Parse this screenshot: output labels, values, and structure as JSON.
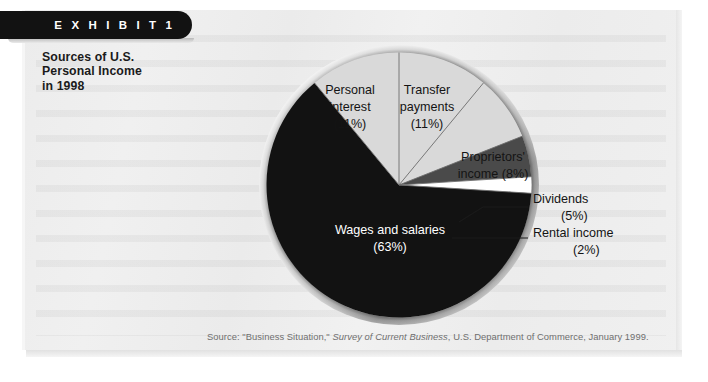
{
  "exhibit": {
    "tab_label": "E X H I B I T   1",
    "title_line1": "Sources of U.S.",
    "title_line2": "Personal Income",
    "title_line3": "in 1998"
  },
  "source_note": {
    "prefix": "Source: \"Business Situation,\" ",
    "italic": "Survey of Current Business",
    "suffix": ", U.S. Department of Commerce, January 1999."
  },
  "chart_data": {
    "type": "pie",
    "title": "Sources of U.S. Personal Income in 1998",
    "units": "percent",
    "legend": "none",
    "start_angle_deg": 0,
    "direction": "clockwise",
    "categories": [
      "Transfer payments",
      "Proprietors' income",
      "Dividends",
      "Rental income",
      "Wages and salaries",
      "Personal interest"
    ],
    "values": [
      11,
      8,
      5,
      2,
      63,
      11
    ],
    "colors": [
      "#d9d9d9",
      "#d9d9d9",
      "#4a4a4a",
      "#ffffff",
      "#121212",
      "#d9d9d9"
    ],
    "slices": [
      {
        "name": "Transfer payments",
        "label_line1": "Transfer",
        "label_line2": "payments",
        "value_label": "(11%)",
        "value": 11,
        "color": "#d9d9d9",
        "label_placement": "inside"
      },
      {
        "name": "Proprietors' income",
        "label_line1": "Proprietors'",
        "label_line2": "income (8%)",
        "value_label": "(8%)",
        "value": 8,
        "color": "#d9d9d9",
        "label_placement": "inside"
      },
      {
        "name": "Dividends",
        "label_line1": "Dividends",
        "label_line2": "(5%)",
        "value_label": "(5%)",
        "value": 5,
        "color": "#4a4a4a",
        "label_placement": "callout"
      },
      {
        "name": "Rental income",
        "label_line1": "Rental income",
        "label_line2": "(2%)",
        "value_label": "(2%)",
        "value": 2,
        "color": "#ffffff",
        "label_placement": "callout"
      },
      {
        "name": "Wages and salaries",
        "label_line1": "Wages and salaries",
        "label_line2": "(63%)",
        "value_label": "(63%)",
        "value": 63,
        "color": "#121212",
        "label_placement": "inside"
      },
      {
        "name": "Personal interest",
        "label_line1": "Personal",
        "label_line2": "interest",
        "label_line3": "(11%)",
        "value_label": "(11%)",
        "value": 11,
        "color": "#d9d9d9",
        "label_placement": "inside"
      }
    ]
  }
}
